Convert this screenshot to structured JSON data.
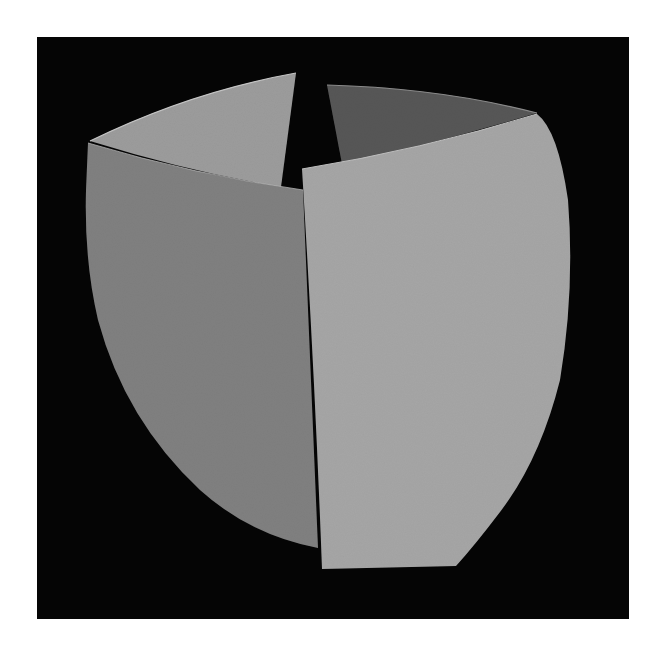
{
  "image": {
    "subject": "sculptural ceramic vessel of four curved panels",
    "background_color": "#050505",
    "page_color": "#ffffff",
    "panels": {
      "inner_left": {
        "color": "#9c9c9c"
      },
      "inner_right": {
        "color": "#575757"
      },
      "front_left": {
        "color": "#808080"
      },
      "front_right": {
        "color": "#a6a6a6"
      }
    }
  }
}
